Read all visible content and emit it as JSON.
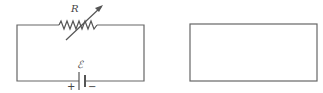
{
  "diagram": {
    "type": "circuit",
    "left_circuit": {
      "components": [
        {
          "kind": "variable-resistor",
          "label": "R",
          "position": "top-wire"
        },
        {
          "kind": "battery",
          "label": "ℰ",
          "position": "bottom-wire",
          "positive_terminal": "+",
          "negative_terminal": "−"
        }
      ]
    },
    "right_box": {
      "kind": "empty-rectangle",
      "content": ""
    },
    "colors": {
      "wire": "#666666",
      "label": "#444444",
      "background": "#ffffff"
    }
  }
}
